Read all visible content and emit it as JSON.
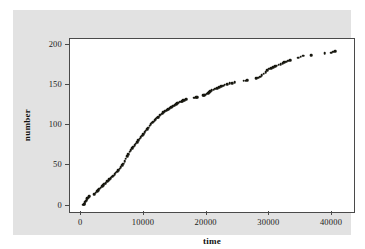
{
  "figure": {
    "panel_color": "#e2e2e2",
    "plot_background": "#ffffff",
    "frame_color": "#4a4a4a",
    "point_color": "#17170f"
  },
  "chart_data": {
    "type": "scatter",
    "title": "",
    "xlabel": "time",
    "ylabel": "number",
    "xlim": [
      -1800,
      43500
    ],
    "ylim": [
      -8,
      207
    ],
    "xticks": [
      0,
      10000,
      20000,
      30000,
      40000
    ],
    "xtick_labels": [
      "0",
      "10000",
      "20000",
      "30000",
      "40000"
    ],
    "yticks": [
      0,
      50,
      100,
      150,
      200
    ],
    "ytick_labels": [
      "0",
      "50",
      "100",
      "150",
      "200"
    ],
    "grid": false,
    "legend": false,
    "marker": "filled-circle",
    "x": [
      300,
      420,
      520,
      640,
      760,
      880,
      980,
      1080,
      1180,
      1280,
      2100,
      2300,
      2500,
      2700,
      2900,
      3100,
      3300,
      3500,
      3700,
      3900,
      4100,
      4300,
      4500,
      4700,
      4900,
      5100,
      5300,
      5500,
      5700,
      5900,
      6100,
      6300,
      6500,
      6700,
      6900,
      7100,
      7300,
      7500,
      7700,
      7900,
      8100,
      8300,
      8500,
      8700,
      8900,
      9100,
      9300,
      9500,
      9700,
      9900,
      10100,
      10300,
      10500,
      10700,
      10900,
      11100,
      11300,
      11500,
      11700,
      11900,
      12100,
      12300,
      12500,
      12700,
      12900,
      13100,
      13300,
      13500,
      13700,
      13900,
      14100,
      14300,
      14500,
      14700,
      14900,
      15100,
      15300,
      15500,
      15700,
      15900,
      16100,
      16300,
      16500,
      16700,
      17900,
      18100,
      18300,
      18500,
      19400,
      19600,
      19800,
      20000,
      20200,
      20400,
      20600,
      20800,
      21100,
      21400,
      21700,
      22000,
      22300,
      22600,
      22900,
      23300,
      23700,
      24100,
      24500,
      25900,
      26200,
      26500,
      27900,
      28200,
      28500,
      28800,
      29100,
      29400,
      29700,
      30000,
      30300,
      30600,
      30900,
      31200,
      31500,
      31800,
      32100,
      32400,
      32700,
      33000,
      33300,
      34600,
      35000,
      35400,
      36700,
      38800,
      39900,
      40200,
      40500
    ],
    "y": [
      1,
      2,
      3,
      5,
      6,
      8,
      9,
      10,
      11,
      12,
      14,
      16,
      18,
      19,
      21,
      22,
      24,
      25,
      27,
      28,
      30,
      31,
      33,
      34,
      36,
      37,
      39,
      41,
      42,
      44,
      46,
      48,
      50,
      52,
      55,
      58,
      61,
      64,
      67,
      69,
      71,
      73,
      75,
      77,
      79,
      81,
      83,
      85,
      87,
      89,
      91,
      93,
      95,
      97,
      99,
      101,
      103,
      104,
      106,
      107,
      109,
      110,
      112,
      113,
      114,
      116,
      117,
      118,
      119,
      120,
      121,
      122,
      123,
      124,
      125,
      126,
      127,
      128,
      129,
      129,
      130,
      131,
      131,
      132,
      134,
      134,
      135,
      135,
      137,
      137,
      138,
      139,
      140,
      141,
      142,
      143,
      144,
      145,
      146,
      147,
      148,
      149,
      150,
      151,
      152,
      152,
      153,
      155,
      155,
      156,
      158,
      159,
      160,
      162,
      164,
      166,
      168,
      170,
      171,
      172,
      173,
      174,
      175,
      176,
      177,
      178,
      179,
      180,
      181,
      184,
      185,
      186,
      187,
      189,
      190,
      191,
      192
    ]
  }
}
